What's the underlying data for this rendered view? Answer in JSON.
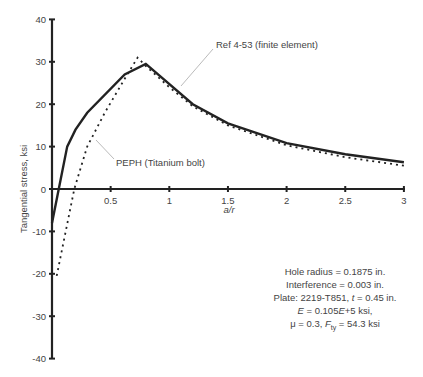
{
  "chart_data": {
    "type": "line",
    "title": "",
    "xlabel": "a/r",
    "ylabel": "Tangential stress, ksi",
    "xlim": [
      0,
      3
    ],
    "ylim": [
      -40,
      40
    ],
    "x_ticks": [
      0.5,
      1,
      1.5,
      2,
      2.5,
      3
    ],
    "x_tick_labels": [
      "0.5",
      "1",
      "1.5",
      "2",
      "2.5",
      "3"
    ],
    "y_ticks": [
      40,
      30,
      20,
      10,
      0,
      -10,
      -20,
      -30,
      -40
    ],
    "y_tick_labels": [
      "40",
      "30",
      "20",
      "10",
      "0",
      "-10",
      "-20",
      "-30",
      "-40"
    ],
    "grid": false,
    "legend": "none (callout labels)",
    "series": [
      {
        "name": "PEPH (Titanium bolt)",
        "style": "solid",
        "x": [
          0,
          0.13,
          0.2,
          0.3,
          0.62,
          0.8,
          1.2,
          1.5,
          2.0,
          2.5,
          3.0
        ],
        "y": [
          -8,
          10,
          14,
          18,
          27,
          29.5,
          20,
          15.5,
          10.8,
          8.2,
          6.3
        ]
      },
      {
        "name": "Ref 4-53 (finite element)",
        "style": "dotted",
        "x": [
          0.04,
          0.19,
          0.3,
          0.45,
          0.62,
          0.73,
          0.8,
          1.0,
          1.2,
          1.5,
          2.0,
          2.5,
          3.0
        ],
        "y": [
          -20.5,
          0,
          10,
          18,
          26,
          31,
          29,
          24,
          19.5,
          15,
          10.3,
          7.5,
          5.5
        ]
      }
    ],
    "annotations": {
      "callout_fe": "Ref 4-53 (finite element)",
      "callout_peph": "PEPH (Titanium bolt)",
      "notes": [
        "Hole radius = 0.1875 in.",
        "Interference = 0.003 in.",
        "Plate: 2219-T851, t = 0.45 in.",
        "E = 0.105E+5 ksi,",
        "μ = 0.3, F_ty = 54.3 ksi"
      ]
    }
  },
  "notes": {
    "line1": "Hole radius = 0.1875 in.",
    "line2": "Interference = 0.003 in.",
    "line3_prefix": "Plate: 2219-T851, ",
    "line3_var": "t",
    "line3_suffix": " = 0.45 in.",
    "line4_var1": "E",
    "line4_mid": " = 0.105",
    "line4_var2": "E",
    "line4_suffix": "+5 ksi,",
    "line5_prefix": "μ = 0.3, ",
    "line5_var": "F",
    "line5_sub": "ty",
    "line5_suffix": " = 54.3 ksi"
  }
}
